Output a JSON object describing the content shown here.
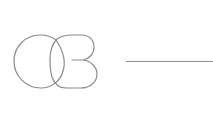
{
  "graphic": {
    "label": "",
    "stroke_color": "#8a8a8a",
    "stroke_width": 1.2,
    "shapes": [
      {
        "type": "circle-loop",
        "description": "left open circle"
      },
      {
        "type": "b-loop",
        "description": "right B-shaped loop with inner tick"
      }
    ]
  },
  "divider": {
    "color": "#8e8e8e",
    "x_start": 126,
    "x_end": 213,
    "y": 61
  }
}
